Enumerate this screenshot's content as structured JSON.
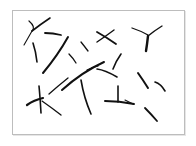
{
  "image": {
    "description": "Abstract figure of thin black curved strokes and branching crack-like marks scattered inside a light gray bordered frame",
    "background_color": "#ffffff",
    "frame_border_color": "#bdbdbd",
    "stroke_color": "#111111",
    "frame": {
      "x": 12,
      "y": 10,
      "width": 171,
      "height": 123
    },
    "stroke_count": 20
  }
}
